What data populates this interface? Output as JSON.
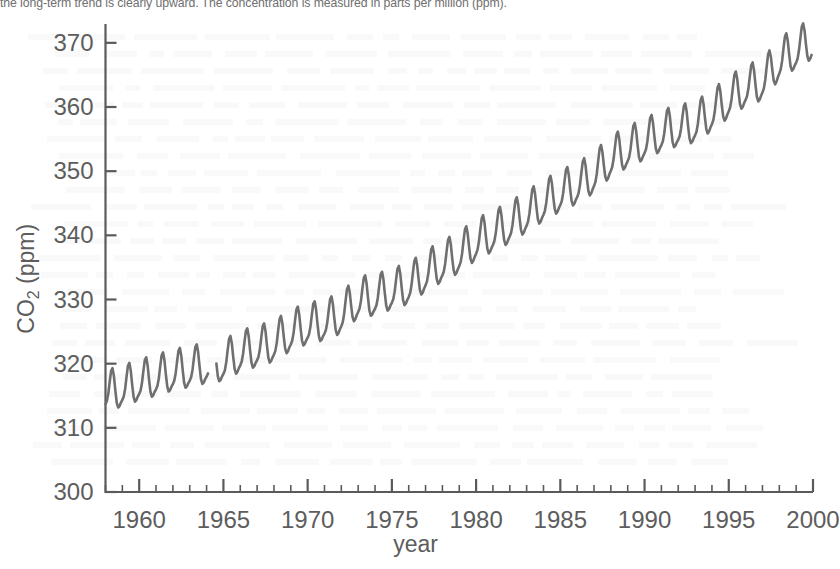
{
  "caption": {
    "text": "the long-term trend is clearly upward. The concentration is measured in parts per million (ppm)."
  },
  "axis_titles": {
    "y_prefix": "CO",
    "y_sub": "2",
    "y_suffix": " (ppm)",
    "y_full": "CO2 (ppm)",
    "x": "year"
  },
  "colors": {
    "line": "#6f6f6f",
    "axis": "#5a5a5a",
    "text": "#5d5d5d",
    "background": "#ffffff"
  },
  "chart_data": {
    "type": "line",
    "title": "",
    "xlabel": "year",
    "ylabel": "CO2 (ppm)",
    "xlim": [
      1958,
      2000
    ],
    "ylim": [
      300,
      372
    ],
    "grid": false,
    "legend": false,
    "legend_position": "none",
    "x_ticks": [
      1960,
      1965,
      1970,
      1975,
      1980,
      1985,
      1990,
      1995,
      2000
    ],
    "x_tick_labels": [
      "1960",
      "1965",
      "1970",
      "1975",
      "1980",
      "1985",
      "1990",
      "1995",
      "2000"
    ],
    "x_minor_tick_step": 1,
    "y_ticks": [
      300,
      310,
      320,
      330,
      340,
      350,
      360,
      370
    ],
    "y_tick_labels": [
      "300",
      "310",
      "320",
      "330",
      "340",
      "350",
      "360",
      "370"
    ],
    "series": [
      {
        "name": "Mauna Loa monthly mean CO2",
        "note": "Monthly mean values; data gap during 1964. Annual sawtooth is the seasonal cycle.",
        "gaps": [
          [
            1964.15,
            1964.55
          ]
        ],
        "annual_mean": {
          "x": [
            1958,
            1959,
            1960,
            1961,
            1962,
            1963,
            1964,
            1965,
            1966,
            1967,
            1968,
            1969,
            1970,
            1971,
            1972,
            1973,
            1974,
            1975,
            1976,
            1977,
            1978,
            1979,
            1980,
            1981,
            1982,
            1983,
            1984,
            1985,
            1986,
            1987,
            1988,
            1989,
            1990,
            1991,
            1992,
            1993,
            1994,
            1995,
            1996,
            1997,
            1998,
            1999
          ],
          "y": [
            315.3,
            315.98,
            316.91,
            317.64,
            318.45,
            318.99,
            319.6,
            320.03,
            321.37,
            322.18,
            323.05,
            324.62,
            325.68,
            326.32,
            327.46,
            329.68,
            330.19,
            331.12,
            332.03,
            333.84,
            335.41,
            336.84,
            338.76,
            340.12,
            341.48,
            343.15,
            344.85,
            346.35,
            347.61,
            349.31,
            351.69,
            353.2,
            354.45,
            355.7,
            356.54,
            357.21,
            358.96,
            360.97,
            362.74,
            363.88,
            366.84,
            368.54
          ]
        },
        "first_value": 316.0,
        "last_value": 368.0,
        "max_value": 371.0,
        "min_value": 312.5,
        "seasonal_amplitude_ppm": 6.0
      }
    ]
  }
}
